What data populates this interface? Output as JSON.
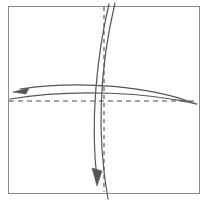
{
  "figure": {
    "name": "fold-diagram",
    "title": "",
    "background_color": "#ffffff",
    "width": 206,
    "height": 200
  },
  "sheet": {
    "name": "paper-sheet",
    "label": "",
    "fill_color": "#ffffff",
    "border_color": "#8a8a8a",
    "border_width": 1,
    "x": 8,
    "y": 6,
    "width": 191,
    "height": 187
  },
  "creases": [
    {
      "id": "vertical-dashed-crease",
      "label": "",
      "style": "dashed",
      "orientation": "vertical",
      "color": "#4a4a4a",
      "stroke_width": 1.1,
      "dash_pattern": "4,4",
      "x": 104,
      "y_start": 7,
      "y_end": 192
    },
    {
      "id": "horizontal-dashed-crease",
      "label": "",
      "style": "dashed",
      "orientation": "horizontal",
      "color": "#4a4a4a",
      "stroke_width": 1.1,
      "dash_pattern": "5,4",
      "y": 101,
      "x_start": 9,
      "x_end": 198
    }
  ],
  "fold_curves": [
    {
      "id": "horizontal-fold-upper",
      "label": "",
      "style": "solid",
      "color": "#555555",
      "stroke_width": 1.2,
      "has_arrow": true,
      "arrow_direction": "left",
      "path": "M 196 104 C 150 86 80 80 20 89"
    },
    {
      "id": "horizontal-fold-lower",
      "label": "",
      "style": "solid",
      "color": "#555555",
      "stroke_width": 1.2,
      "has_arrow": false,
      "arrow_direction": "",
      "path": "M 197 104 C 150 93 75 88 10 99"
    },
    {
      "id": "vertical-fold-left",
      "label": "",
      "style": "solid",
      "color": "#555555",
      "stroke_width": 1.2,
      "has_arrow": true,
      "arrow_direction": "down",
      "path": "M 109 4 C 97 55 90 120 97 180"
    },
    {
      "id": "vertical-fold-right",
      "label": "",
      "style": "solid",
      "color": "#555555",
      "stroke_width": 1.2,
      "has_arrow": false,
      "arrow_direction": "",
      "path": "M 115 3 C 102 58 95 126 108 199"
    }
  ],
  "arrows": [
    {
      "id": "left-arrowhead",
      "label": "",
      "points": "13,92 29,88 26,94",
      "color": "#555555",
      "direction": "left"
    },
    {
      "id": "down-arrowhead",
      "label": "",
      "points": "97,186 92,168 102,171",
      "color": "#555555",
      "direction": "down"
    }
  ],
  "palette": {
    "line_color": "#555555",
    "crease_color": "#4a4a4a",
    "frame_color": "#8a8a8a",
    "background": "#ffffff"
  }
}
